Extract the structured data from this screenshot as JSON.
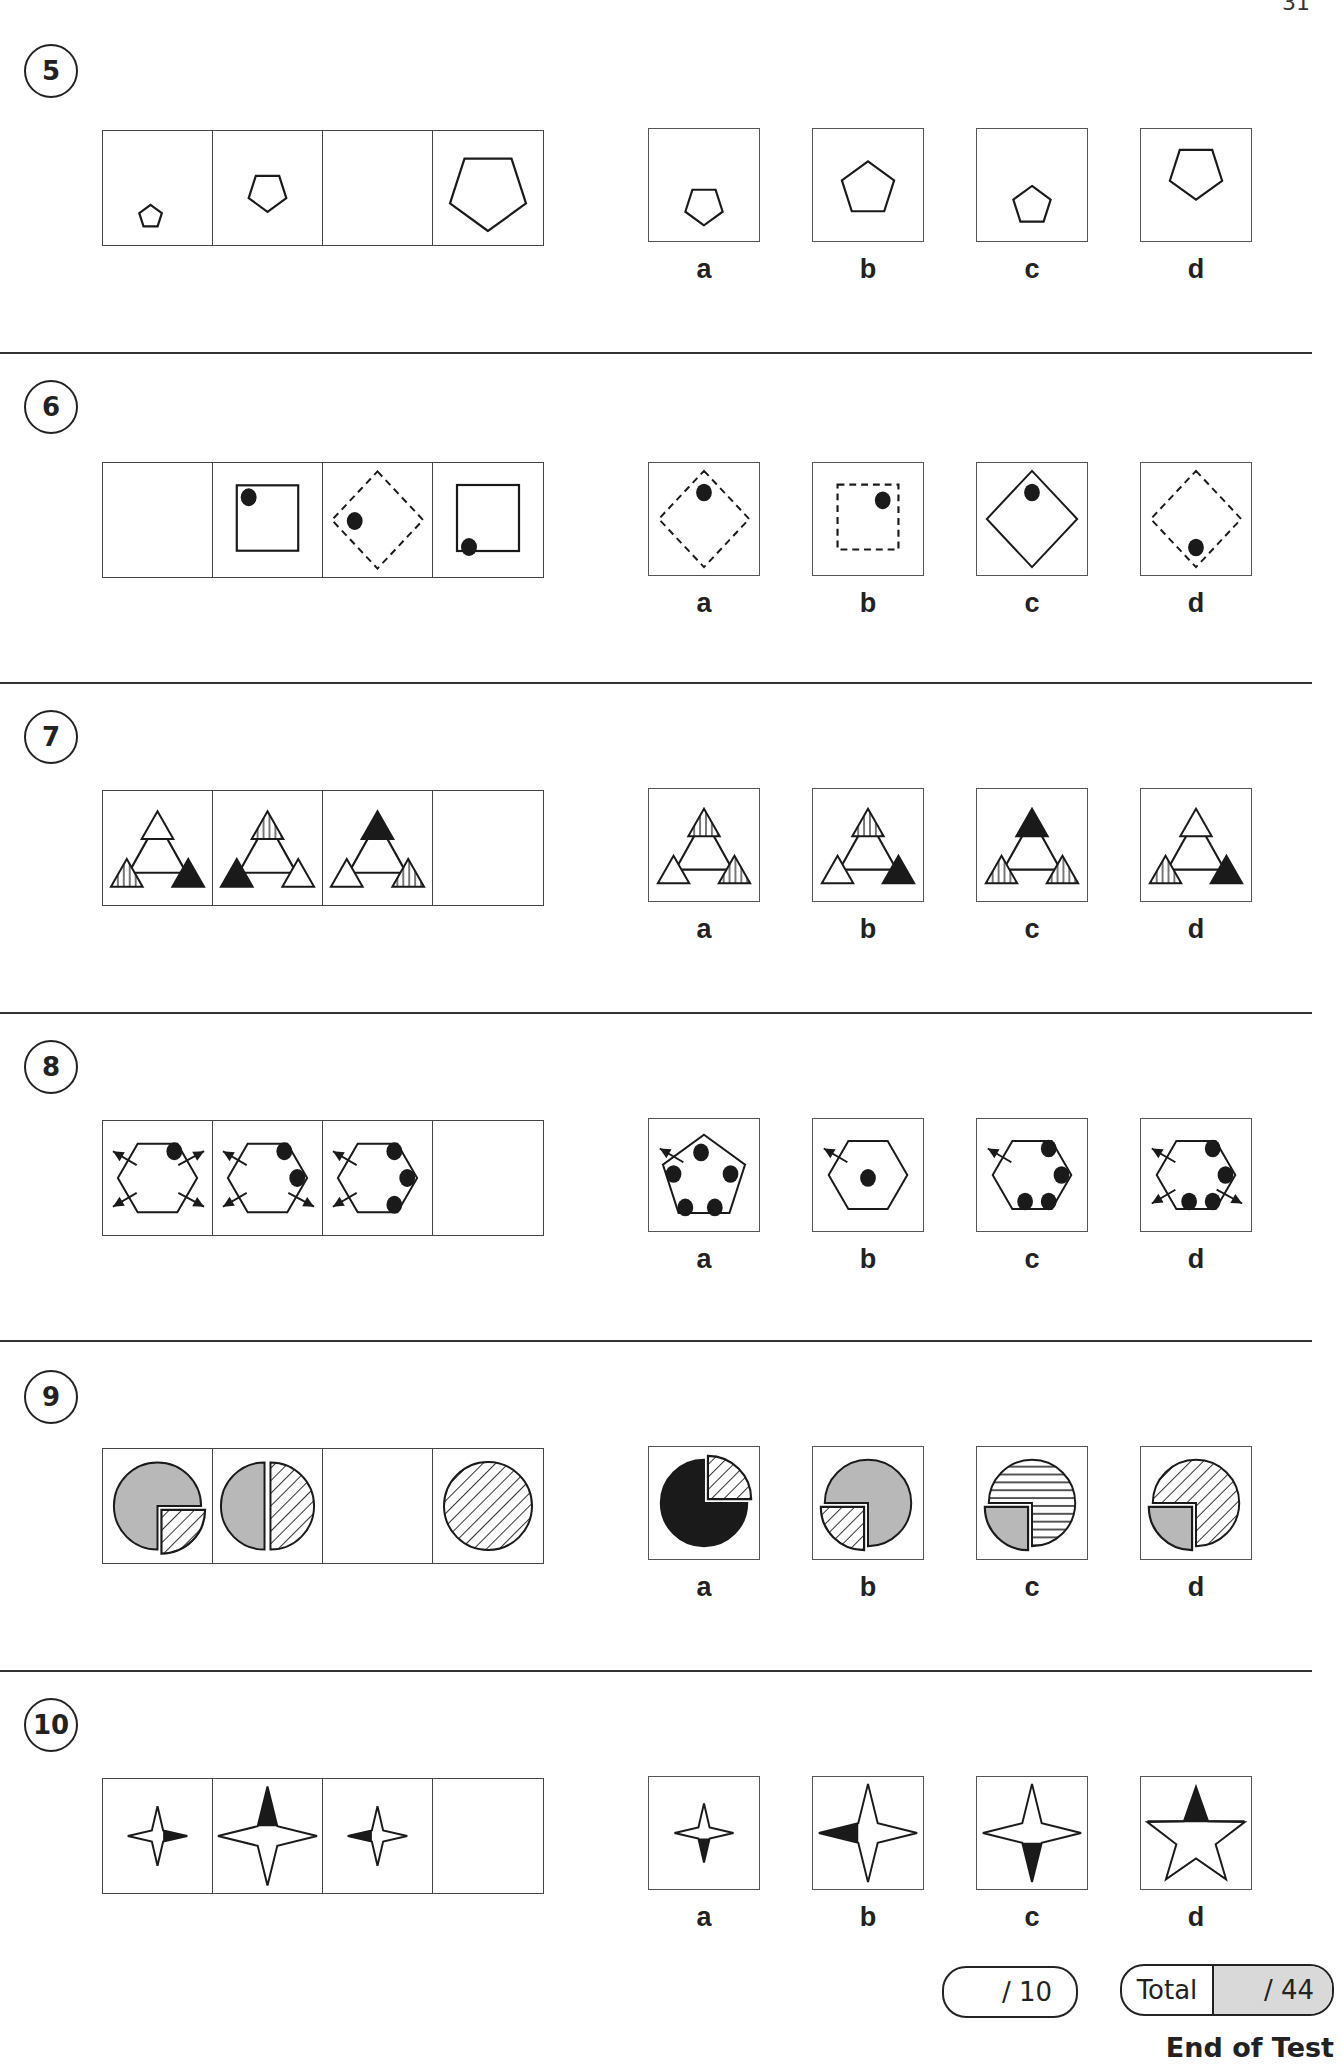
{
  "page": {
    "number_partial": "31"
  },
  "questions": [
    {
      "number": "5",
      "series": [
        {
          "shape": "pentagon",
          "size": "xs",
          "pos": "bottom",
          "orient": "up"
        },
        {
          "shape": "pentagon",
          "size": "sm",
          "pos": "mid",
          "orient": "down"
        },
        {
          "shape": "blank"
        },
        {
          "shape": "pentagon",
          "size": "lg",
          "pos": "top",
          "orient": "down"
        }
      ],
      "options": [
        {
          "label": "a",
          "figure": {
            "shape": "pentagon",
            "size": "sm",
            "pos": "bottom",
            "orient": "down"
          }
        },
        {
          "label": "b",
          "figure": {
            "shape": "pentagon",
            "size": "md",
            "pos": "mid",
            "orient": "up"
          }
        },
        {
          "label": "c",
          "figure": {
            "shape": "pentagon",
            "size": "sm",
            "pos": "bottom",
            "orient": "up"
          }
        },
        {
          "label": "d",
          "figure": {
            "shape": "pentagon",
            "size": "md",
            "pos": "top",
            "orient": "down"
          }
        }
      ]
    },
    {
      "number": "6",
      "series": [
        {
          "shape": "blank"
        },
        {
          "shape": "square",
          "stroke": "solid",
          "dot": "top-left"
        },
        {
          "shape": "diamond",
          "stroke": "dashed",
          "dot": "left"
        },
        {
          "shape": "square",
          "stroke": "solid",
          "dot": "bottom-left"
        }
      ],
      "options": [
        {
          "label": "a",
          "figure": {
            "shape": "diamond",
            "stroke": "dashed",
            "dot": "top"
          }
        },
        {
          "label": "b",
          "figure": {
            "shape": "square",
            "stroke": "dashed",
            "dot": "top-right"
          }
        },
        {
          "label": "c",
          "figure": {
            "shape": "diamond",
            "stroke": "solid",
            "dot": "top"
          }
        },
        {
          "label": "d",
          "figure": {
            "shape": "diamond",
            "stroke": "dashed",
            "dot": "bottom"
          }
        }
      ]
    },
    {
      "number": "7",
      "series": [
        {
          "shape": "triad",
          "fills": {
            "top": "white",
            "left": "striped",
            "right": "black"
          }
        },
        {
          "shape": "triad",
          "fills": {
            "top": "striped",
            "left": "black",
            "right": "white"
          }
        },
        {
          "shape": "triad",
          "fills": {
            "top": "black",
            "left": "white",
            "right": "striped"
          }
        },
        {
          "shape": "blank"
        }
      ],
      "options": [
        {
          "label": "a",
          "figure": {
            "shape": "triad",
            "fills": {
              "top": "striped",
              "left": "white",
              "right": "striped"
            }
          }
        },
        {
          "label": "b",
          "figure": {
            "shape": "triad",
            "fills": {
              "top": "striped",
              "left": "white",
              "right": "black"
            }
          }
        },
        {
          "label": "c",
          "figure": {
            "shape": "triad",
            "fills": {
              "top": "black",
              "left": "striped",
              "right": "striped"
            }
          }
        },
        {
          "label": "d",
          "figure": {
            "shape": "triad",
            "fills": {
              "top": "white",
              "left": "striped",
              "right": "black"
            }
          }
        }
      ]
    },
    {
      "number": "8",
      "series": [
        {
          "shape": "hexagon",
          "dots": [
            "tr"
          ],
          "arrows": [
            "tl",
            "tr",
            "bl",
            "br"
          ]
        },
        {
          "shape": "hexagon",
          "dots": [
            "tr",
            "r"
          ],
          "arrows": [
            "tl",
            "bl",
            "br"
          ]
        },
        {
          "shape": "hexagon",
          "dots": [
            "tr",
            "r",
            "br"
          ],
          "arrows": [
            "tl",
            "bl"
          ]
        },
        {
          "shape": "blank"
        }
      ],
      "options": [
        {
          "label": "a",
          "figure": {
            "shape": "pentagon-dots",
            "dots": [
              "top",
              "l",
              "r",
              "bl",
              "br"
            ],
            "arrows": [
              "tl"
            ]
          }
        },
        {
          "label": "b",
          "figure": {
            "shape": "hexagon",
            "dots": [
              "c"
            ],
            "arrows": [
              "tl"
            ]
          }
        },
        {
          "label": "c",
          "figure": {
            "shape": "hexagon",
            "dots": [
              "tr",
              "r",
              "br",
              "bm"
            ],
            "arrows": [
              "tl"
            ]
          }
        },
        {
          "label": "d",
          "figure": {
            "shape": "hexagon",
            "dots": [
              "tr",
              "r",
              "br",
              "bm"
            ],
            "arrows": [
              "tl",
              "bl",
              "br"
            ]
          }
        }
      ]
    },
    {
      "number": "9",
      "series": [
        {
          "shape": "pie",
          "main": "grey",
          "piece": "hatched",
          "piece_pos": "bottom-right",
          "pieceFrac": "quarter"
        },
        {
          "shape": "pie",
          "main": "grey",
          "piece": "hatched",
          "piece_pos": "right",
          "pieceFrac": "half"
        },
        {
          "shape": "blank"
        },
        {
          "shape": "pie",
          "main": "hatched",
          "piece": "none"
        }
      ],
      "options": [
        {
          "label": "a",
          "figure": {
            "shape": "pie",
            "main": "black",
            "piece": "hatched",
            "piece_pos": "top-right",
            "pieceFrac": "quarter"
          }
        },
        {
          "label": "b",
          "figure": {
            "shape": "pie",
            "main": "grey",
            "piece": "hatched",
            "piece_pos": "bottom-left",
            "pieceFrac": "quarter"
          }
        },
        {
          "label": "c",
          "figure": {
            "shape": "pie",
            "main": "hlines",
            "piece": "grey",
            "piece_pos": "bottom-left",
            "pieceFrac": "quarter"
          }
        },
        {
          "label": "d",
          "figure": {
            "shape": "pie",
            "main": "hatched",
            "piece": "grey",
            "piece_pos": "bottom-left",
            "pieceFrac": "quarter"
          }
        }
      ]
    },
    {
      "number": "10",
      "series": [
        {
          "shape": "star4",
          "size": "sm",
          "black": "right"
        },
        {
          "shape": "star4",
          "size": "lg",
          "black": "top"
        },
        {
          "shape": "star4",
          "size": "sm",
          "black": "left"
        },
        {
          "shape": "blank"
        }
      ],
      "options": [
        {
          "label": "a",
          "figure": {
            "shape": "star4",
            "size": "sm",
            "black": "bottom"
          }
        },
        {
          "label": "b",
          "figure": {
            "shape": "star4",
            "size": "lg",
            "black": "left"
          }
        },
        {
          "label": "c",
          "figure": {
            "shape": "star4",
            "size": "lg",
            "black": "bottom"
          }
        },
        {
          "label": "d",
          "figure": {
            "shape": "star5",
            "size": "lg",
            "black": "top"
          }
        }
      ]
    }
  ],
  "scores": {
    "section_score": "/ 10",
    "total_label": "Total",
    "total_score": "/ 44"
  },
  "footer": {
    "end_label": "End of Test"
  },
  "colors": {
    "ink": "#1a1a1a",
    "grey_fill": "#b8b8b8",
    "total_bg": "#d9d9d9"
  }
}
